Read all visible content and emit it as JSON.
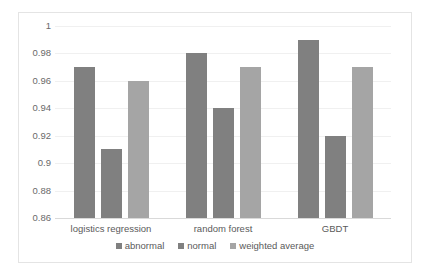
{
  "chart_data": {
    "type": "bar",
    "title": "",
    "subtitle": "",
    "xlabel": "",
    "ylabel": "",
    "categories": [
      "logistics regression",
      "random forest",
      "GBDT"
    ],
    "series": [
      {
        "name": "abnormal",
        "color": "#808080",
        "values": [
          0.97,
          0.98,
          0.99
        ]
      },
      {
        "name": "normal",
        "color": "#808080",
        "values": [
          0.91,
          0.94,
          0.92
        ]
      },
      {
        "name": "weighted average",
        "color": "#a5a5a5",
        "values": [
          0.96,
          0.97,
          0.97
        ]
      }
    ],
    "ylim": [
      0.86,
      1.0
    ],
    "yticks": [
      0.86,
      0.88,
      0.9,
      0.92,
      0.94,
      0.96,
      0.98,
      1
    ],
    "ytick_labels": [
      "0.86",
      "0.88",
      "0.9",
      "0.92",
      "0.94",
      "0.96",
      "0.98",
      "1"
    ],
    "grid": true,
    "grid_color": "#f0f0f0",
    "legend_position": "bottom",
    "plot_border_color": "#e4e4e4",
    "background": "#ffffff"
  }
}
